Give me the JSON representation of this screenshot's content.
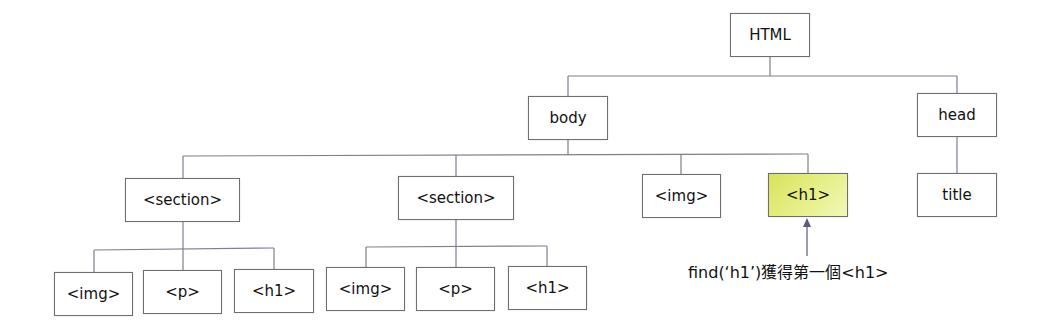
{
  "diagram": {
    "type": "dom-tree",
    "line_color": "#7f7f90",
    "highlight_color": "#dde86e",
    "nodes": {
      "html": {
        "label": "HTML"
      },
      "body": {
        "label": "body"
      },
      "head": {
        "label": "head"
      },
      "title": {
        "label": "title"
      },
      "section1": {
        "label": "<section>"
      },
      "section2": {
        "label": "<section>"
      },
      "img_body": {
        "label": "<img>"
      },
      "h1_body": {
        "label": "<h1>",
        "highlighted": true
      },
      "s1_img": {
        "label": "<img>"
      },
      "s1_p": {
        "label": "<p>"
      },
      "s1_h1": {
        "label": "<h1>"
      },
      "s2_img": {
        "label": "<img>"
      },
      "s2_p": {
        "label": "<p>"
      },
      "s2_h1": {
        "label": "<h1>"
      }
    },
    "edges": [
      [
        "html",
        "body"
      ],
      [
        "html",
        "head"
      ],
      [
        "head",
        "title"
      ],
      [
        "body",
        "section1"
      ],
      [
        "body",
        "section2"
      ],
      [
        "body",
        "img_body"
      ],
      [
        "body",
        "h1_body"
      ],
      [
        "section1",
        "s1_img"
      ],
      [
        "section1",
        "s1_p"
      ],
      [
        "section1",
        "s1_h1"
      ],
      [
        "section2",
        "s2_img"
      ],
      [
        "section2",
        "s2_p"
      ],
      [
        "section2",
        "s2_h1"
      ]
    ],
    "annotation": {
      "target": "h1_body",
      "text": "find(‘h1’)獲得第一個<h1>"
    }
  }
}
